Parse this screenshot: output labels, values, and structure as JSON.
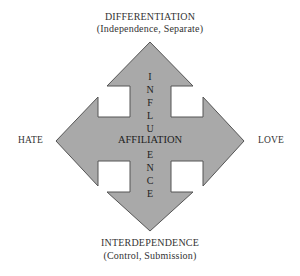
{
  "diagram": {
    "top": {
      "title": "DIFFERENTIATION",
      "subtitle": "(Independence, Separate)"
    },
    "bottom": {
      "title": "INTERDEPENDENCE",
      "subtitle": "(Control, Submission)"
    },
    "left": {
      "label": "HATE"
    },
    "right": {
      "label": "LOVE"
    },
    "center": {
      "label": "AFFILIATION"
    },
    "vertical_axis": {
      "letters_top": [
        "I",
        "N",
        "F",
        "L",
        "U"
      ],
      "letters_bottom": [
        "E",
        "N",
        "C",
        "E"
      ],
      "word": "INFLUENCE"
    },
    "colors": {
      "arrow_fill": "#a9a9a9",
      "arrow_stroke": "#555555",
      "text": "#333333"
    }
  }
}
